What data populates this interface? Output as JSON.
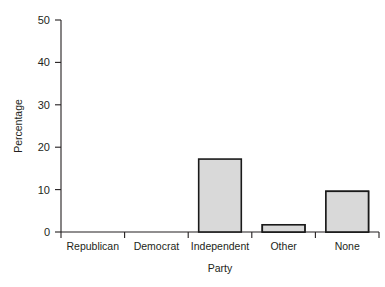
{
  "chart_data": {
    "type": "bar",
    "title": "",
    "xlabel": "Party",
    "ylabel": "Percentage",
    "categories": [
      "Republican",
      "Democrat",
      "Independent",
      "Other",
      "None"
    ],
    "values": [
      45.3,
      25.8,
      17.2,
      1.7,
      9.6
    ],
    "ylim": [
      0,
      50
    ],
    "yticks": [
      0,
      10,
      20,
      30,
      40,
      50
    ],
    "ytick_labels": [
      "0",
      "10",
      "20",
      "30",
      "40",
      "50"
    ],
    "grid": false,
    "legend": "none",
    "bar_fill_color": "#d9d9d9",
    "bar_edge_color": "#1a1a1a",
    "background_color": "#ffffff"
  },
  "axes": {
    "y_title": "Percentage",
    "x_title": "Party"
  }
}
